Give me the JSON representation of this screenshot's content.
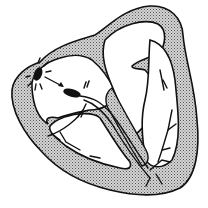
{
  "diagram": {
    "labels_visible": false,
    "colors": {
      "ink": "#111111",
      "myocardium_fill": "#b8b8b8",
      "background": "#ffffff"
    },
    "structures": [
      {
        "id": "sa-node",
        "name": "Sinoatrial node (with radiating impulse lines)"
      },
      {
        "id": "internodal-arrow",
        "name": "Impulse arrow to AV node"
      },
      {
        "id": "av-node",
        "name": "Atrioventricular node"
      },
      {
        "id": "av-delay-marks",
        "name": "Dashed marks at AV junction"
      },
      {
        "id": "bundle-of-his",
        "name": "Bundle of His / bundle branches"
      },
      {
        "id": "purkinje-fibers",
        "name": "Purkinje fibers"
      },
      {
        "id": "atrial-wall",
        "name": "Atrial myocardium (stippled)"
      },
      {
        "id": "ventricular-wall",
        "name": "Ventricular myocardium (stippled)"
      },
      {
        "id": "septum",
        "name": "Interventricular septum"
      }
    ]
  }
}
